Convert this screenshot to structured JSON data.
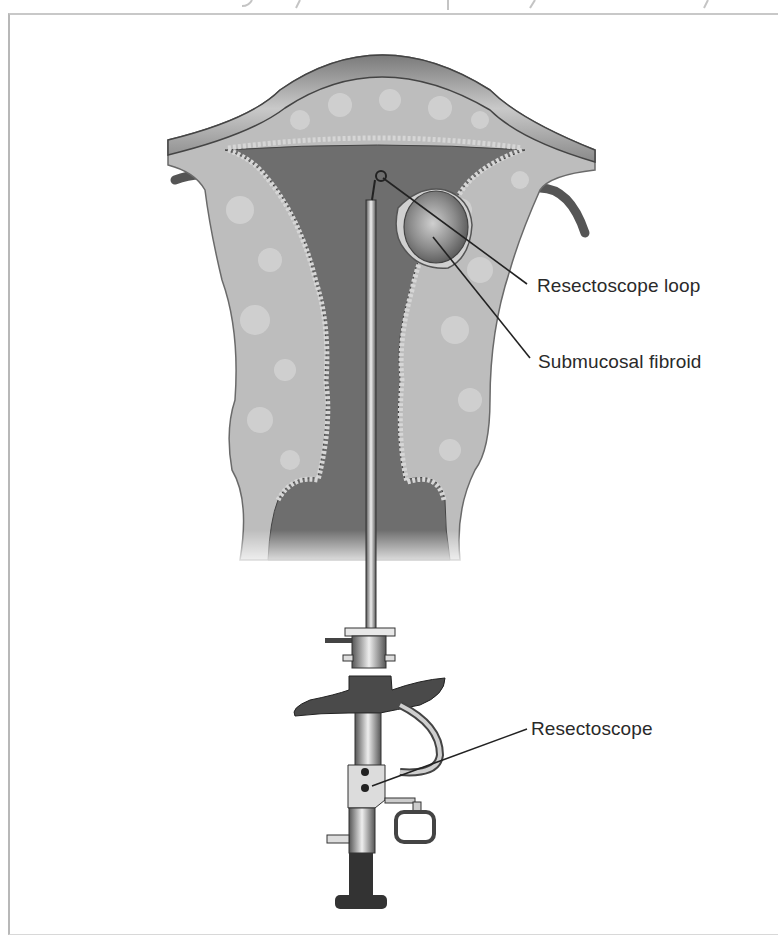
{
  "figure": {
    "labels": {
      "loop": "Resectoscope loop",
      "fibroid": "Submucosal fibroid",
      "resectoscope": "Resectoscope"
    },
    "colors": {
      "tissue": "#b9b9b9",
      "cavity": "#6e6e6e",
      "serosa": "#9a9a9a",
      "instrument_dark": "#3e3e3e",
      "leader_line": "#222222",
      "text": "#2a2a2a",
      "frame": "#b8b8b8"
    }
  }
}
